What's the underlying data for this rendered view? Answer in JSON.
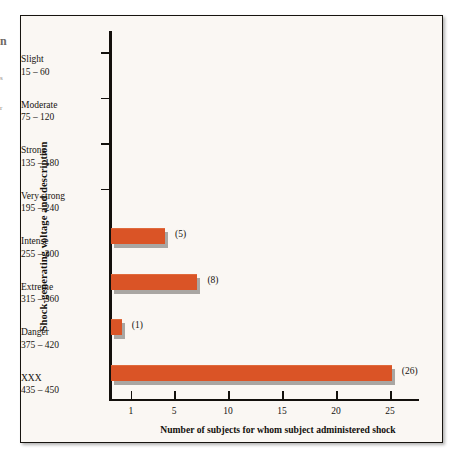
{
  "margin_fragments": {
    "a": "n",
    "b": "s",
    "c": "r"
  },
  "chart_data": {
    "type": "bar",
    "orientation": "horizontal",
    "title": "",
    "xlabel": "Number of subjects for whom subject administered shock",
    "ylabel": "Shock-generating voltage and description",
    "categories": [
      "Slight\n15 – 60",
      "Moderate\n75 – 120",
      "Strong\n135 – 180",
      "Very strong\n195 – 240",
      "Intense\n255 – 300",
      "Extreme\n315 – 360",
      "Danger\n375 – 420",
      "XXX\n435 – 450"
    ],
    "category_rows": [
      {
        "name": "Slight",
        "range": "15 – 60",
        "value": 0,
        "value_label": ""
      },
      {
        "name": "Moderate",
        "range": "75 – 120",
        "value": 0,
        "value_label": ""
      },
      {
        "name": "Strong",
        "range": "135 – 180",
        "value": 0,
        "value_label": ""
      },
      {
        "name": "Very strong",
        "range": "195 – 240",
        "value": 0,
        "value_label": ""
      },
      {
        "name": "Intense",
        "range": "255 – 300",
        "value": 5,
        "value_label": "(5)"
      },
      {
        "name": "Extreme",
        "range": "315 – 360",
        "value": 8,
        "value_label": "(8)"
      },
      {
        "name": "Danger",
        "range": "375 – 420",
        "value": 1,
        "value_label": "(1)"
      },
      {
        "name": "XXX",
        "range": "435 – 450",
        "value": 26,
        "value_label": "(26)"
      }
    ],
    "values": [
      0,
      0,
      0,
      0,
      5,
      8,
      1,
      26
    ],
    "value_labels": [
      "",
      "",
      "",
      "",
      "(5)",
      "(8)",
      "(1)",
      "(26)"
    ],
    "xticks": [
      1,
      5,
      10,
      15,
      20,
      25
    ],
    "xtick_labels": [
      "1",
      "5",
      "10",
      "15",
      "20",
      "25"
    ],
    "xlim": [
      0,
      27.5
    ],
    "grid": false,
    "legend": null,
    "colors": {
      "bar": "#da5426",
      "bar_shadow": "#a9a6a2",
      "axis": "#13100c",
      "text": "#15120e",
      "panel_background": "#faf7f3",
      "frame_border": "#17140f"
    }
  }
}
